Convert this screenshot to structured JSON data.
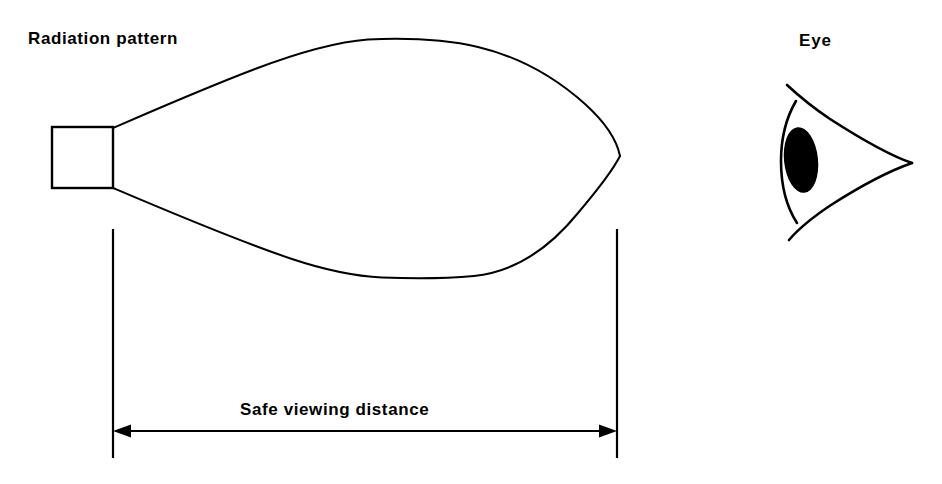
{
  "figure": {
    "background_color": "#ffffff",
    "ink_color": "#000000",
    "width": 942,
    "height": 484
  },
  "labels": {
    "radiation_pattern": "Radiation pattern",
    "eye": "Eye",
    "safe_viewing_distance": "Safe viewing distance"
  },
  "emitter": {
    "name": "emitter-source-box",
    "shape": "rectangle",
    "x": 52,
    "y": 127,
    "width": 61,
    "height": 61
  },
  "beam": {
    "name": "radiation-pattern-lobe",
    "shape": "teardrop",
    "origin_x": 113,
    "aperture_top_y": 128,
    "aperture_bottom_y": 188,
    "tip_x": 620,
    "tip_y": 156,
    "max_top_y": 39,
    "max_bottom_y": 278
  },
  "dimension": {
    "name": "safe-viewing-distance-dimension",
    "arrow_y": 431,
    "left_x": 113,
    "right_x": 617,
    "extension_top_y": 229,
    "extension_bottom_y": 458,
    "arrowhead_length": 17,
    "arrowhead_half_height": 7,
    "double_headed": true
  },
  "eye": {
    "name": "eye-diagram",
    "corner_x": 912,
    "corner_y": 163,
    "pupil": {
      "center_x": 801,
      "center_y": 160,
      "radius_x": 17,
      "radius_y": 33,
      "rotation_deg": -6,
      "color": "#000000"
    }
  }
}
